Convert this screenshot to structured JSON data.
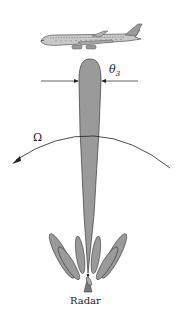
{
  "figure": {
    "type": "radar-antenna-beam-diagram",
    "labels": {
      "beamwidth_symbol": "θ",
      "beamwidth_subscript": "3",
      "rotation_symbol": "Ω",
      "radar_label": "Radar"
    },
    "elements": {
      "target": "aircraft",
      "main_lobe": "narrow vertical main beam",
      "side_lobes_count": 6,
      "rotation_arrow_direction": "counter-clockwise (pointing left)"
    },
    "colors": {
      "lobe_fill": "#9a9a9a",
      "lobe_stroke": "#3a3a3a",
      "line": "#222222",
      "aircraft_body": "#c8c8c8",
      "background": "#ffffff"
    }
  }
}
